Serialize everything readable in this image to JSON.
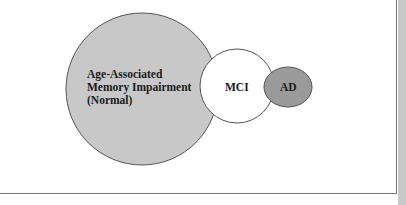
{
  "diagram": {
    "nodes": [
      {
        "id": "aami",
        "label_lines": [
          "Age-Associated",
          "Memory Impairment",
          "(Normal)"
        ],
        "fill": "#c8c8c8",
        "shape": "circle"
      },
      {
        "id": "mci",
        "label": "MCI",
        "fill": "#ffffff",
        "shape": "circle"
      },
      {
        "id": "ad",
        "label": "AD",
        "fill": "#9a9a9a",
        "shape": "ellipse"
      }
    ],
    "stroke_color": "#555555"
  }
}
